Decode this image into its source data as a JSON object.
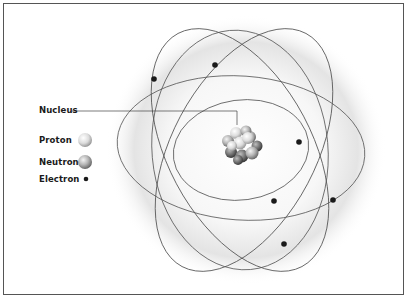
{
  "diagram": {
    "type": "atom-model",
    "labels": {
      "nucleus": "Nucleus",
      "proton": "Proton",
      "neutron": "Neutron",
      "electron": "Electron"
    },
    "legend": [
      {
        "label": "Proton",
        "symbol": "light-sphere"
      },
      {
        "label": "Neutron",
        "symbol": "gray-sphere"
      },
      {
        "label": "Electron",
        "symbol": "small-dark-dot"
      }
    ],
    "electron_count": 6,
    "orbit_count": 5,
    "colors": {
      "orbit": "#555555",
      "electron": "#1a1a1a",
      "proton": "#e8e8e8",
      "neutron": "#a8a8a8",
      "glow": "#d9d9d9"
    }
  }
}
